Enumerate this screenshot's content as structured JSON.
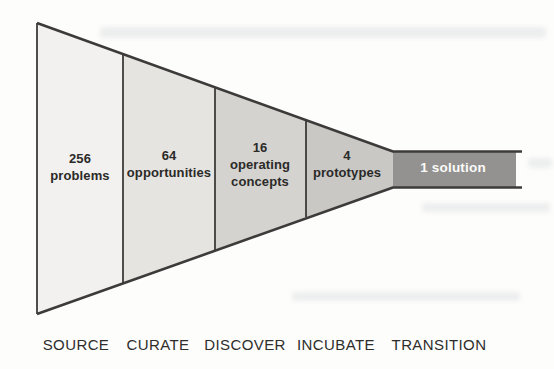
{
  "diagram": {
    "outline_color": "#3d3b39",
    "stages": [
      {
        "name": "SOURCE",
        "count": "256",
        "label": "problems",
        "color": "#f2f1ef"
      },
      {
        "name": "CURATE",
        "count": "64",
        "label": "opportunities",
        "color": "#e5e4e1"
      },
      {
        "name": "DISCOVER",
        "count": "16",
        "label": "operating concepts",
        "color": "#d4d3d0"
      },
      {
        "name": "INCUBATE",
        "count": "4",
        "label": "prototypes",
        "color": "#c9c8c5"
      },
      {
        "name": "TRANSITION",
        "count": "1",
        "label": "solution",
        "color": "#939290",
        "result_text": "1 solution"
      }
    ]
  }
}
